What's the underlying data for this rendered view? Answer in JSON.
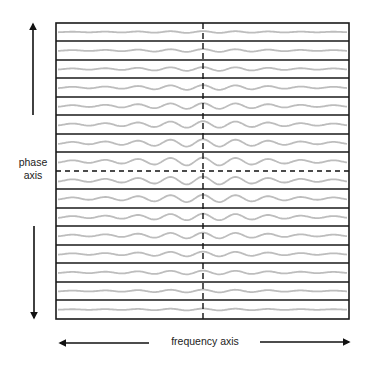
{
  "labels": {
    "phase_axis_line1": "phase",
    "phase_axis_line2": "axis",
    "frequency_axis": "frequency axis"
  },
  "colors": {
    "frame": "#1a1a1a",
    "wave": "#bdbdbd",
    "arrow": "#111111",
    "background": "#ffffff"
  },
  "frame": {
    "left": 56,
    "top": 23,
    "right": 349,
    "bottom": 319
  },
  "center": {
    "x": 203,
    "dashed_row_y": 171
  },
  "rows": {
    "row_lines_y": [
      23,
      41,
      60,
      78,
      97,
      115,
      134,
      152,
      189,
      208,
      226,
      245,
      263,
      282,
      300,
      319
    ],
    "wave_centers_y": [
      32,
      50.5,
      69,
      87.5,
      106,
      124.5,
      143,
      161.5,
      180.5,
      198.5,
      217,
      235.5,
      254,
      272.5,
      291,
      309.5
    ],
    "wave_amplitudes": [
      0.9,
      1.4,
      1.9,
      2.4,
      2.9,
      3.3,
      3.7,
      4.0,
      4.0,
      3.7,
      3.3,
      2.9,
      2.4,
      1.9,
      1.4,
      0.9
    ]
  },
  "arrows": {
    "phase_up": {
      "x": 33,
      "y1": 115,
      "y2": 24
    },
    "phase_down": {
      "x": 34,
      "y1": 226,
      "y2": 318
    },
    "freq_left": {
      "y": 343,
      "x1": 149,
      "x2": 60
    },
    "freq_right": {
      "y": 342,
      "x1": 260,
      "x2": 349
    }
  }
}
